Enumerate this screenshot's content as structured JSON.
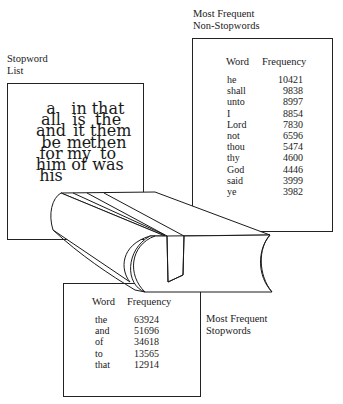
{
  "stopword_list": {
    "caption_line1": "Stopword",
    "caption_line2": "List",
    "columns": [
      [
        "a",
        "all",
        "and",
        "be",
        "for",
        "him",
        "his"
      ],
      [
        "in",
        "is",
        "it",
        "me",
        "my",
        "of"
      ],
      [
        "that",
        "the",
        "them",
        "then",
        "to",
        "was"
      ]
    ]
  },
  "non_stopwords": {
    "caption_line1": "Most Frequent",
    "caption_line2": "Non-Stopwords",
    "header_word": "Word",
    "header_frequency": "Frequency",
    "rows": [
      {
        "word": "he",
        "frequency": "10421"
      },
      {
        "word": "shall",
        "frequency": "9838"
      },
      {
        "word": "unto",
        "frequency": "8997"
      },
      {
        "word": "I",
        "frequency": "8854"
      },
      {
        "word": "Lord",
        "frequency": "7830"
      },
      {
        "word": "not",
        "frequency": "6596"
      },
      {
        "word": "thou",
        "frequency": "5474"
      },
      {
        "word": "thy",
        "frequency": "4600"
      },
      {
        "word": "God",
        "frequency": "4446"
      },
      {
        "word": "said",
        "frequency": "3999"
      },
      {
        "word": "ye",
        "frequency": "3982"
      }
    ]
  },
  "stopwords": {
    "caption_line1": "Most Frequent",
    "caption_line2": "Stopwords",
    "header_word": "Word",
    "header_frequency": "Frequency",
    "rows": [
      {
        "word": "the",
        "frequency": "63924"
      },
      {
        "word": "and",
        "frequency": "51696"
      },
      {
        "word": "of",
        "frequency": "34618"
      },
      {
        "word": "to",
        "frequency": "13565"
      },
      {
        "word": "that",
        "frequency": "12914"
      }
    ]
  },
  "book": {
    "icon": "book-icon"
  }
}
